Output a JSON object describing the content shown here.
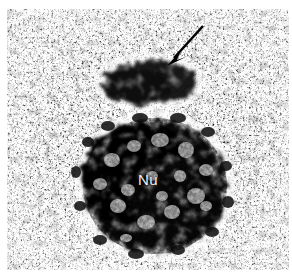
{
  "figure": {
    "kind": "transmission-electron-micrograph",
    "width": 292,
    "height": 278,
    "background_color": "#ffffff",
    "plate_color": "#fdfdfd"
  },
  "labels": [
    {
      "id": "nucleolus",
      "text": "Nu",
      "color": "#f2f2f2",
      "x": 138,
      "y": 172,
      "font_size": 15
    }
  ],
  "annotations": [
    {
      "id": "arrow",
      "icon": "arrow-icon",
      "color": "#000000",
      "tail_x": 203,
      "tail_y": 26,
      "tip_x": 167,
      "tip_y": 66,
      "direction": "down-left",
      "points_to": "perinucleolar-dense-body"
    }
  ],
  "structures": [
    {
      "id": "nucleolus-body",
      "name": "Nu",
      "center_x": 155,
      "center_y": 186,
      "radius_x": 72,
      "radius_y": 68,
      "tone": "#0d0d0d"
    },
    {
      "id": "perinucleolar-dense-body",
      "name": "arrowed dense mass",
      "center_x": 150,
      "center_y": 82,
      "radius_x": 48,
      "radius_y": 24,
      "tone": "#101010"
    },
    {
      "id": "nucleoplasm-granules",
      "name": "granular background",
      "tone": "#1a1a1a"
    }
  ],
  "chart_data": {
    "type": "heatmap",
    "title": "",
    "xlabel": "",
    "ylabel": "",
    "tone_scale": [
      "#ffffff",
      "#c8c8c8",
      "#7a7a7a",
      "#303030",
      "#000000"
    ]
  }
}
